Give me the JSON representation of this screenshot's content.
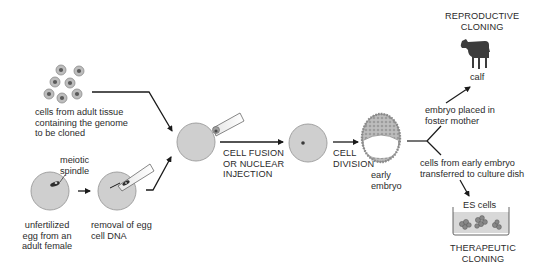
{
  "diagram": {
    "colors": {
      "cell_fill": "#cfcfcf",
      "cell_stroke": "#9a9a9a",
      "nucleus": "#4a4a4a",
      "arrow": "#1a1a1a",
      "text": "#2b2b2b",
      "calf": "#3c3c3c",
      "dish_fill": "#d8d8d8"
    },
    "nodes": [
      {
        "id": "adult_cells",
        "label": "cells from adult tissue\ncontaining the genome\nto be cloned"
      },
      {
        "id": "egg",
        "label": "unfertilized\negg from an\nadult female"
      },
      {
        "id": "spindle",
        "label": "meiotic\nspindle"
      },
      {
        "id": "enucleation",
        "label": "removal of egg\ncell DNA"
      },
      {
        "id": "fusion",
        "label": "CELL FUSION\nOR NUCLEAR\nINJECTION"
      },
      {
        "id": "division",
        "label": "CELL\nDIVISION"
      },
      {
        "id": "early_embryo",
        "label": "early\nembryo"
      },
      {
        "id": "foster",
        "label": "embryo placed in\nfoster mother"
      },
      {
        "id": "calf",
        "label": "calf"
      },
      {
        "id": "reproductive",
        "label": "REPRODUCTIVE\nCLONING"
      },
      {
        "id": "culture",
        "label": "cells from early embryo\ntransferred to culture dish"
      },
      {
        "id": "es_cells",
        "label": "ES cells"
      },
      {
        "id": "therapeutic",
        "label": "THERAPEUTIC\nCLONING"
      }
    ],
    "edges": [
      {
        "from": "adult_cells",
        "to": "fusion_cell"
      },
      {
        "from": "egg",
        "to": "enucleation"
      },
      {
        "from": "enucleation",
        "to": "fusion_cell"
      },
      {
        "from": "fusion_cell",
        "to": "single_cell",
        "label": "CELL FUSION OR NUCLEAR INJECTION"
      },
      {
        "from": "single_cell",
        "to": "early_embryo",
        "label": "CELL DIVISION"
      },
      {
        "from": "early_embryo",
        "to": "calf",
        "label": "embryo placed in foster mother"
      },
      {
        "from": "early_embryo",
        "to": "es_cells",
        "label": "cells from early embryo transferred to culture dish"
      }
    ]
  }
}
